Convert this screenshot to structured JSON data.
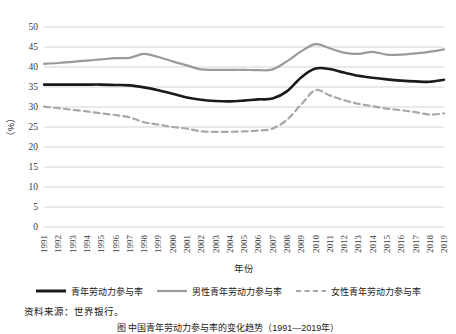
{
  "chart_data": {
    "type": "line",
    "title": "",
    "xlabel": "年份",
    "ylabel": "（%）",
    "ylim": [
      0,
      50
    ],
    "yticks": [
      0,
      5,
      10,
      15,
      20,
      25,
      30,
      35,
      40,
      45,
      50
    ],
    "grid": true,
    "legend_position": "bottom",
    "categories": [
      "1991",
      "1992",
      "1993",
      "1994",
      "1995",
      "1996",
      "1997",
      "1998",
      "1999",
      "2000",
      "2001",
      "2002",
      "2003",
      "2004",
      "2005",
      "2006",
      "2007",
      "2008",
      "2009",
      "2010",
      "2011",
      "2012",
      "2013",
      "2014",
      "2015",
      "2016",
      "2017",
      "2018",
      "2019"
    ],
    "series": [
      {
        "name": "青年劳动力参与率",
        "color": "#1a1a1a",
        "style": "solid",
        "width": 2.6,
        "values": [
          35.6,
          35.6,
          35.6,
          35.6,
          35.6,
          35.5,
          35.4,
          34.9,
          34.2,
          33.3,
          32.4,
          31.8,
          31.5,
          31.4,
          31.6,
          31.9,
          32.1,
          33.9,
          37.4,
          39.6,
          39.5,
          38.6,
          37.8,
          37.3,
          36.9,
          36.6,
          36.4,
          36.3,
          36.8
        ]
      },
      {
        "name": "男性青年劳动力参与率",
        "color": "#9a9a9a",
        "style": "solid",
        "width": 2.2,
        "values": [
          40.8,
          41.0,
          41.3,
          41.6,
          41.9,
          42.2,
          42.3,
          43.3,
          42.5,
          41.4,
          40.4,
          39.4,
          39.3,
          39.3,
          39.3,
          39.2,
          39.4,
          41.4,
          43.9,
          45.7,
          44.7,
          43.6,
          43.3,
          43.8,
          43.1,
          43.1,
          43.4,
          43.8,
          44.4
        ]
      },
      {
        "name": "女性青年劳动力参与率",
        "color": "#a8a8a8",
        "style": "dashed",
        "width": 2.2,
        "values": [
          30.1,
          29.7,
          29.3,
          28.9,
          28.4,
          28.0,
          27.4,
          26.2,
          25.6,
          25.0,
          24.6,
          23.9,
          23.8,
          23.8,
          23.9,
          24.1,
          24.6,
          26.8,
          30.6,
          34.2,
          32.9,
          31.7,
          30.8,
          30.2,
          29.6,
          29.2,
          28.7,
          28.1,
          28.4
        ]
      }
    ]
  },
  "axes": {
    "y_title": "（%）",
    "x_title": "年份"
  },
  "legend": {
    "items": [
      {
        "label": "青年劳动力参与率",
        "color": "#1a1a1a",
        "style": "solid"
      },
      {
        "label": "男性青年劳动力参与率",
        "color": "#9a9a9a",
        "style": "solid"
      },
      {
        "label": "女性青年劳动力参与率",
        "color": "#a8a8a8",
        "style": "dashed"
      }
    ]
  },
  "source": {
    "text": "资料来源：世界银行。"
  },
  "caption": {
    "text": "图 中国青年劳动力参与率的变化趋势（1991—2019年）"
  }
}
